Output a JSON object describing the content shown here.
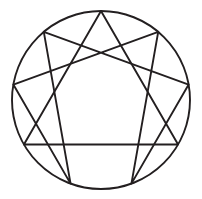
{
  "figure": {
    "name": "enneagram",
    "background_color": "#ffffff",
    "stroke_color": "#231f20",
    "canvas": {
      "width": 202,
      "height": 199
    }
  },
  "geometry": {
    "center": {
      "x": 101,
      "y": 100
    },
    "radius": 89,
    "point_count": 9,
    "angle_step_degrees": 40,
    "start_angle_degrees": -90
  },
  "circle": {
    "name": "outer-circle",
    "cx": 101,
    "cy": 100,
    "r": 89,
    "stroke_width": 1.9,
    "stroke_color": "#231f20"
  },
  "points": [
    {
      "index": 1,
      "label": "1",
      "angle_degrees": -50,
      "x": 158.21,
      "y": 31.83
    },
    {
      "index": 2,
      "label": "2",
      "angle_degrees": -10,
      "x": 188.65,
      "y": 84.54
    },
    {
      "index": 3,
      "label": "3",
      "angle_degrees": 30,
      "x": 178.08,
      "y": 144.5
    },
    {
      "index": 4,
      "label": "4",
      "angle_degrees": 70,
      "x": 131.44,
      "y": 183.63
    },
    {
      "index": 5,
      "label": "5",
      "angle_degrees": 110,
      "x": 70.56,
      "y": 183.63
    },
    {
      "index": 6,
      "label": "6",
      "angle_degrees": 150,
      "x": 23.92,
      "y": 144.5
    },
    {
      "index": 7,
      "label": "7",
      "angle_degrees": 190,
      "x": 13.35,
      "y": 84.54
    },
    {
      "index": 8,
      "label": "8",
      "angle_degrees": 230,
      "x": 43.79,
      "y": 31.83
    },
    {
      "index": 9,
      "label": "9",
      "angle_degrees": 270,
      "x": 101.0,
      "y": 11.0
    }
  ],
  "shapes": [
    {
      "name": "inner-triangle",
      "kind": "triangle",
      "point_sequence": [
        9,
        3,
        6
      ],
      "closed": true,
      "stroke_width": 1.9,
      "stroke_color": "#231f20"
    },
    {
      "name": "hexad-path",
      "kind": "hexagram",
      "point_sequence": [
        1,
        4,
        2,
        8,
        5,
        7
      ],
      "closed": true,
      "stroke_width": 1.9,
      "stroke_color": "#231f20"
    }
  ],
  "edges": [
    {
      "name": "edge-9-3",
      "shape": "inner-triangle",
      "from": 9,
      "to": 3
    },
    {
      "name": "edge-3-6",
      "shape": "inner-triangle",
      "from": 3,
      "to": 6
    },
    {
      "name": "edge-6-9",
      "shape": "inner-triangle",
      "from": 6,
      "to": 9
    },
    {
      "name": "edge-1-4",
      "shape": "hexad-path",
      "from": 1,
      "to": 4
    },
    {
      "name": "edge-4-2",
      "shape": "hexad-path",
      "from": 4,
      "to": 2
    },
    {
      "name": "edge-2-8",
      "shape": "hexad-path",
      "from": 2,
      "to": 8
    },
    {
      "name": "edge-8-5",
      "shape": "hexad-path",
      "from": 8,
      "to": 5
    },
    {
      "name": "edge-5-7",
      "shape": "hexad-path",
      "from": 5,
      "to": 7
    },
    {
      "name": "edge-7-1",
      "shape": "hexad-path",
      "from": 7,
      "to": 1
    }
  ]
}
